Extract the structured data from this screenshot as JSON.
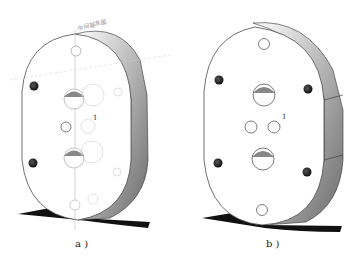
{
  "figure": {
    "panels": [
      {
        "id": "a",
        "caption": "a )",
        "annotation_text": "中间基准面",
        "description": "Oval plate with construction/reference geometry visible, faint hidden holes, two dark pin holes"
      },
      {
        "id": "b",
        "caption": "b )",
        "description": "Finished oval plate with top/bottom small holes, central large hole, two small angled holes, two dark pin holes"
      }
    ],
    "axis_label": "1",
    "colors": {
      "outline": "#333333",
      "shadow": "#111111",
      "dark_hole": "#2a2a2a",
      "construction_line": "#bbbbbb"
    }
  }
}
